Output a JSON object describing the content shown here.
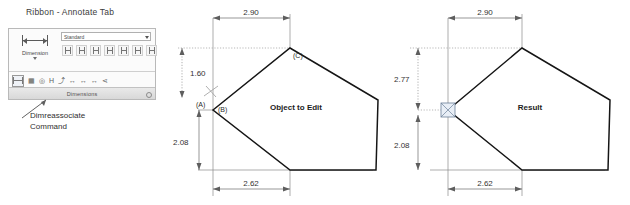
{
  "ribbon": {
    "title": "Ribbon - Annotate Tab",
    "dimension_button_label": "Dimension",
    "style_combo_value": "Standard",
    "panel_label": "Dimensions",
    "dim_tools": [
      {
        "name": "linear-dimension-tool",
        "glyph": "↦"
      },
      {
        "name": "aligned-dimension-tool",
        "glyph": "⤡"
      },
      {
        "name": "angular-dimension-tool",
        "glyph": "∠"
      },
      {
        "name": "arc-length-dimension-tool",
        "glyph": "⌒"
      },
      {
        "name": "radius-dimension-tool",
        "glyph": "⊘"
      },
      {
        "name": "diameter-dimension-tool",
        "glyph": "⌀"
      },
      {
        "name": "ordinate-dimension-tool",
        "glyph": "⊥"
      }
    ],
    "lower_tools": [
      {
        "name": "dimreassociate-tool",
        "glyph": "⇄"
      },
      {
        "name": "dimension-break-tool",
        "glyph": "⬚"
      },
      {
        "name": "dimension-inspect-tool",
        "glyph": "◎"
      },
      {
        "name": "dimension-jogged-tool",
        "glyph": "H"
      },
      {
        "name": "dimension-jog-line-tool",
        "glyph": "⤴"
      },
      {
        "name": "dimension-continue-tool",
        "glyph": "↔"
      },
      {
        "name": "dimension-baseline-tool",
        "glyph": "↔"
      },
      {
        "name": "dimension-space-tool",
        "glyph": "↔"
      },
      {
        "name": "dimension-update-tool",
        "glyph": "⋖"
      }
    ],
    "callout_line1": "Dimreassociate",
    "callout_line2": "Command"
  },
  "drawings": [
    {
      "id": "object-to-edit",
      "caption": "Object to Edit",
      "dimensions": {
        "top": "2.90",
        "left_upper": "1.60",
        "left_lower": "2.08",
        "bottom": "2.62"
      },
      "vertex_labels": {
        "a": "(A)",
        "b": "(B)",
        "c": "(C)"
      }
    },
    {
      "id": "result",
      "caption": "Result",
      "dimensions": {
        "top": "2.90",
        "left_upper": "2.77",
        "left_lower": "2.08",
        "bottom": "2.62"
      },
      "vertex_labels": {}
    }
  ],
  "colors": {
    "object_stroke": "#151515",
    "dimension_line": "#6b6b6b",
    "grip_fill": "#e8eef6",
    "grip_stroke": "#6b7f99"
  }
}
